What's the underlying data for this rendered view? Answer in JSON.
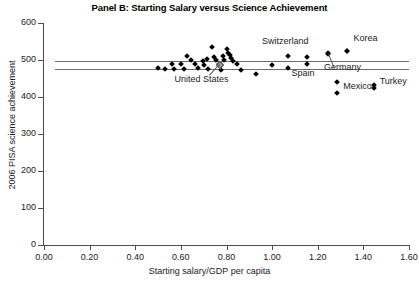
{
  "chart_data": {
    "type": "scatter",
    "title": "Panel B: Starting Salary versus Science Achievement",
    "xlabel": "Starting salary/GDP per capita",
    "ylabel": "2006 PISA science achievement",
    "xlim": [
      0.0,
      1.6
    ],
    "ylim": [
      0,
      600
    ],
    "xticks": [
      "0.00",
      "0.20",
      "0.40",
      "0.60",
      "0.80",
      "1.00",
      "1.20",
      "1.40",
      "1.60"
    ],
    "xtick_values": [
      0.0,
      0.2,
      0.4,
      0.6,
      0.8,
      1.0,
      1.2,
      1.4,
      1.6
    ],
    "yticks": [
      "0",
      "100",
      "200",
      "300",
      "400",
      "500",
      "600"
    ],
    "ytick_values": [
      0,
      100,
      200,
      300,
      400,
      500,
      600
    ],
    "grid": false,
    "legend": "none",
    "reference_lines": [
      {
        "name": "upper-reference-line",
        "y": 498,
        "x_start": 0.05,
        "x_end": 1.6
      },
      {
        "name": "lower-reference-line",
        "y": 476,
        "x_start": 0.05,
        "x_end": 1.6
      }
    ],
    "points": [
      {
        "x": 0.5,
        "y": 478
      },
      {
        "x": 0.53,
        "y": 477
      },
      {
        "x": 0.56,
        "y": 488
      },
      {
        "x": 0.57,
        "y": 476
      },
      {
        "x": 0.6,
        "y": 490
      },
      {
        "x": 0.615,
        "y": 476
      },
      {
        "x": 0.625,
        "y": 510
      },
      {
        "x": 0.645,
        "y": 500
      },
      {
        "x": 0.66,
        "y": 488
      },
      {
        "x": 0.675,
        "y": 478
      },
      {
        "x": 0.695,
        "y": 498
      },
      {
        "x": 0.7,
        "y": 487
      },
      {
        "x": 0.715,
        "y": 503
      },
      {
        "x": 0.72,
        "y": 476
      },
      {
        "x": 0.735,
        "y": 534
      },
      {
        "x": 0.745,
        "y": 508
      },
      {
        "x": 0.755,
        "y": 500
      },
      {
        "x": 0.765,
        "y": 490
      },
      {
        "x": 0.775,
        "y": 472
      },
      {
        "x": 0.785,
        "y": 512
      },
      {
        "x": 0.79,
        "y": 500
      },
      {
        "x": 0.8,
        "y": 530
      },
      {
        "x": 0.805,
        "y": 519
      },
      {
        "x": 0.815,
        "y": 513
      },
      {
        "x": 0.82,
        "y": 506
      },
      {
        "x": 0.83,
        "y": 496
      },
      {
        "x": 0.845,
        "y": 488
      },
      {
        "x": 0.865,
        "y": 474
      },
      {
        "x": 0.93,
        "y": 463
      },
      {
        "x": 1.0,
        "y": 486
      },
      {
        "x": 1.07,
        "y": 478
      },
      {
        "x": 1.155,
        "y": 508
      },
      {
        "x": 1.245,
        "y": 520
      },
      {
        "x": 1.285,
        "y": 440
      },
      {
        "x": 1.33,
        "y": 523
      },
      {
        "x": 1.445,
        "y": 432
      }
    ],
    "labeled_points": [
      {
        "country": "United States",
        "x": 0.765,
        "y": 489,
        "marker": "hollow"
      },
      {
        "country": "Switzerland",
        "x": 1.07,
        "y": 512
      },
      {
        "country": "Korea",
        "x": 1.33,
        "y": 523
      },
      {
        "country": "Spain",
        "x": 1.155,
        "y": 488
      },
      {
        "country": "Germany",
        "x": 1.245,
        "y": 516
      },
      {
        "country": "Mexico",
        "x": 1.285,
        "y": 410
      },
      {
        "country": "Turkey",
        "x": 1.445,
        "y": 424
      }
    ]
  },
  "labels": {
    "united_states": "United States",
    "switzerland": "Switzerland",
    "korea": "Korea",
    "spain": "Spain",
    "germany": "Germany",
    "mexico": "Mexico",
    "turkey": "Turkey"
  },
  "colors": {
    "marker": "#000000",
    "axis": "#4c4c4c",
    "reference_line": "#6b6b6b",
    "text": "#1a1a1a",
    "background": "#ffffff"
  }
}
